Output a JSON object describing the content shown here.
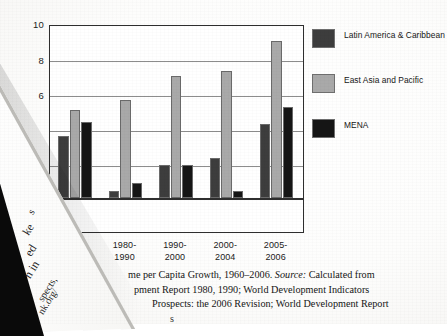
{
  "chart_data": {
    "type": "bar",
    "title": "",
    "xlabel": "",
    "ylabel": "",
    "ylim": [
      -1,
      10
    ],
    "yticks": [
      10,
      8,
      6
    ],
    "grid": true,
    "legend_position": "right",
    "categories": [
      "1970-1980",
      "1980-1990",
      "1990-2000",
      "2000-2004",
      "2005-2006"
    ],
    "series": [
      {
        "name": "Latin America & Caribbean",
        "color": "#3d3d3d",
        "values": [
          3.6,
          0.4,
          1.9,
          2.3,
          4.3
        ]
      },
      {
        "name": "East Asia and Pacific",
        "color": "#a9a9a9",
        "values": [
          5.1,
          5.7,
          7.1,
          7.4,
          9.1
        ]
      },
      {
        "name": "MENA",
        "color": "#151515",
        "values": [
          4.4,
          0.9,
          1.9,
          0.4,
          5.3
        ]
      }
    ]
  },
  "axis": {
    "yticks": [
      "10",
      "8",
      "6"
    ],
    "xticks": [
      {
        "line1": "70-",
        "line2": "'"
      },
      {
        "line1": "1980-",
        "line2": "1990"
      },
      {
        "line1": "1990-",
        "line2": "2000"
      },
      {
        "line1": "2000-",
        "line2": "2004"
      },
      {
        "line1": "2005-",
        "line2": "2006"
      }
    ]
  },
  "legend": {
    "items": [
      {
        "label": "Latin America & Caribbean",
        "color": "#3d3d3d"
      },
      {
        "label": "East Asia and Pacific",
        "color": "#a9a9a9"
      },
      {
        "label": "MENA",
        "color": "#151515"
      }
    ]
  },
  "caption": {
    "line1_pre": "me per Capita Growth, 1960–2006. ",
    "line1_italic": "Source:",
    "line1_post": " Calculated from",
    "line2": "pment Report 1980, 1990; World Development Indicators",
    "line3": "Prospects: the 2006 Revision; World Development Report",
    "line4": "s"
  },
  "fold": {
    "fragments": [
      {
        "text": "s"
      },
      {
        "text": "ke"
      },
      {
        "text": "ed"
      },
      {
        "text": "n in"
      },
      {
        "text": "spects,"
      },
      {
        "text": "nk.org/"
      }
    ]
  }
}
